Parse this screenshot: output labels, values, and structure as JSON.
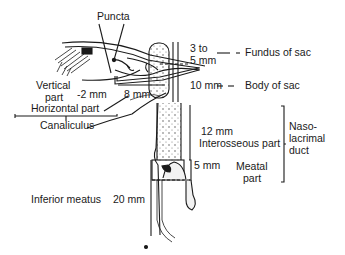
{
  "figure": {
    "colors": {
      "ink": "#1a1a1a",
      "background": "#ffffff",
      "stipple": "#555555"
    }
  },
  "labels": {
    "puncta": "Puncta",
    "vertical_part_line1": "Vertical",
    "vertical_part_line2": "part",
    "vertical_length": "-2 mm",
    "horizontal_length": "8 mm",
    "horizontal_part": "Horizontal part",
    "canaliculus": "Canaliculus",
    "fundus_size_line1": "3 to",
    "fundus_size_line2": "5 mm",
    "fundus_leader": "— –",
    "fundus_of_sac": "Fundus of sac",
    "body_size": "10 mm",
    "body_leader": "– –",
    "body_of_sac": "Body of sac",
    "interosseous_size": "12 mm",
    "interosseous_part": "Interosseous part",
    "meatal_size": "5 mm",
    "meatal_part_line1": "Meatal",
    "meatal_part_line2": "part",
    "nasolacrimal_line1": "Naso-",
    "nasolacrimal_line2": "lacrimal",
    "nasolacrimal_line3": "duct",
    "inferior_meatus": "Inferior meatus",
    "inferior_meatus_size": "20 mm"
  }
}
